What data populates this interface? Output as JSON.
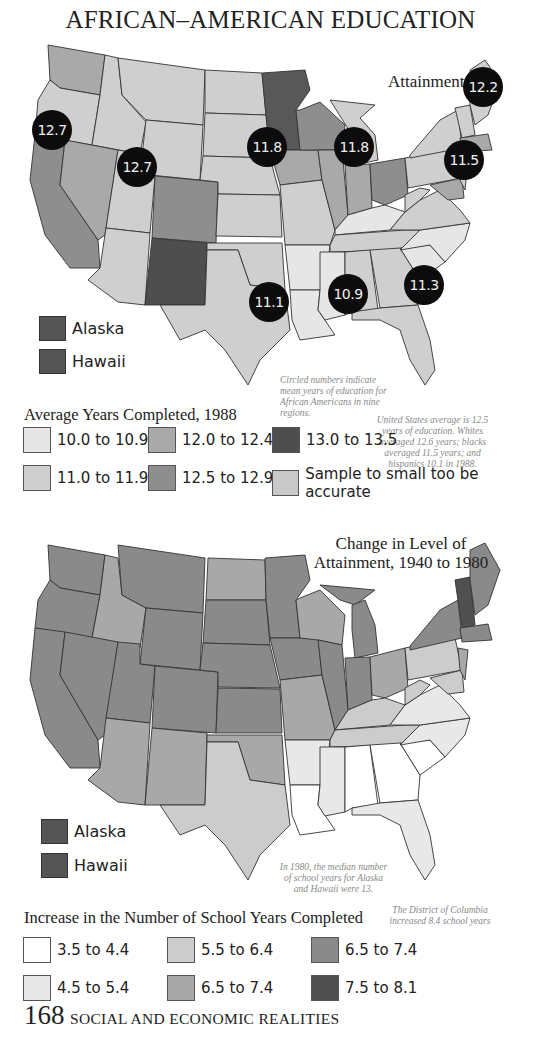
{
  "title": "AFRICAN–AMERICAN EDUCATION",
  "map1": {
    "subtitle": "Attainment",
    "circles": [
      {
        "label": "12.7",
        "x": 32,
        "y": 110
      },
      {
        "label": "12.7",
        "x": 117,
        "y": 147
      },
      {
        "label": "11.8",
        "x": 247,
        "y": 127
      },
      {
        "label": "11.8",
        "x": 334,
        "y": 127
      },
      {
        "label": "12.2",
        "x": 463,
        "y": 67
      },
      {
        "label": "11.5",
        "x": 444,
        "y": 140
      },
      {
        "label": "11.1",
        "x": 249,
        "y": 282
      },
      {
        "label": "10.9",
        "x": 328,
        "y": 274
      },
      {
        "label": "11.3",
        "x": 404,
        "y": 265
      }
    ],
    "insets": [
      {
        "label": "Alaska",
        "color": "#585858"
      },
      {
        "label": "Hawaii",
        "color": "#585858"
      }
    ],
    "note_circled": "Circled numbers indicate mean years of education for African Americans in nine regions.",
    "note_us": "United States average is 12.5 years of education. Whites averaged 12.6 years; blacks averaged 11.5 years; and hispanics 10.1 in 1988.",
    "legend_title": "Average Years Completed, 1988",
    "legend": [
      {
        "label": "10.0 to 10.9",
        "color": "#e6e6e6"
      },
      {
        "label": "12.0 to 12.4",
        "color": "#a9a9a9"
      },
      {
        "label": "13.0 to 13.5",
        "color": "#4e4e4e"
      },
      {
        "label": "11.0 to 11.9",
        "color": "#cfcfcf"
      },
      {
        "label": "12.5 to 12.9",
        "color": "#8e8e8e"
      },
      {
        "label": "Sample to small too be accurate",
        "color": "#c9c9c9"
      }
    ]
  },
  "map2": {
    "subtitle_line1": "Change in Level of",
    "subtitle_line2": "Attainment, 1940 to 1980",
    "insets": [
      {
        "label": "Alaska",
        "color": "#585858"
      },
      {
        "label": "Hawaii",
        "color": "#585858"
      }
    ],
    "note_ak_hi": "In 1980, the median number of school years for Alaska and Hawaii were 13.",
    "note_dc": "The District of Columbia increased 8.4 school years",
    "legend_title": "Increase in the Number of School Years Completed",
    "legend": [
      {
        "label": "3.5 to 4.4",
        "color": "#ffffff"
      },
      {
        "label": "5.5 to 6.4",
        "color": "#cccccc"
      },
      {
        "label": "6.5 to 7.4",
        "color": "#8a8a8a"
      },
      {
        "label": "4.5 to 5.4",
        "color": "#e8e8e8"
      },
      {
        "label": "6.5 to 7.4",
        "color": "#a8a8a8"
      },
      {
        "label": "7.5 to 8.1",
        "color": "#505050"
      }
    ]
  },
  "footer": {
    "page_number": "168",
    "section": "SOCIAL AND ECONOMIC REALITIES"
  }
}
